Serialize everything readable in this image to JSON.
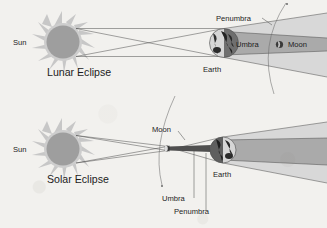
{
  "figure": {
    "background_color": "#f2f1ee",
    "ink_color": "#1c1c1c",
    "line_color": "#4a4a4a"
  },
  "panels": [
    {
      "id": "lunar",
      "title": "Lunar Eclipse",
      "sun_label": "Sun",
      "earth_label": "Earth",
      "moon_label": "Moon",
      "umbra_label": "Umbra",
      "penumbra_label": "Penumbra"
    },
    {
      "id": "solar",
      "title": "Solar Eclipse",
      "sun_label": "Sun",
      "earth_label": "Earth",
      "moon_label": "Moon",
      "umbra_label": "Umbra",
      "penumbra_label": "Penumbra"
    }
  ],
  "colors": {
    "sun_disc": "#9a9a9a",
    "sun_corona": "#c9c9c9",
    "penumbra_fill": "#cfcfcf",
    "umbra_fill": "#a3a3a3",
    "umbra_dark": "#5d5d5d",
    "earth_light": "#d8d8d8",
    "earth_dark": "#6e6e6e",
    "moon_body": "#3c3c3c"
  }
}
